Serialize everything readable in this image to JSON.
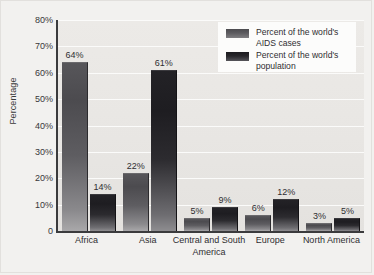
{
  "chart_data": {
    "type": "bar",
    "title": "",
    "subtitle": "",
    "xlabel": "",
    "ylabel": "Percentage",
    "categories": [
      "Africa",
      "Asia",
      "Central and South America",
      "Europe",
      "North America"
    ],
    "series": [
      {
        "name": "Percent of the world's AIDS cases",
        "values": [
          64,
          22,
          5,
          6,
          3
        ],
        "value_labels": [
          "64%",
          "22%",
          "5%",
          "6%",
          "3%"
        ],
        "color": "#4c4b4f"
      },
      {
        "name": "Percent of the world's population",
        "values": [
          14,
          61,
          9,
          12,
          5
        ],
        "value_labels": [
          "14%",
          "61%",
          "9%",
          "12%",
          "5%"
        ],
        "color": "#1c1b1f"
      }
    ],
    "ylim": [
      0,
      80
    ],
    "yticks": [
      0,
      10,
      20,
      30,
      40,
      50,
      60,
      70,
      80
    ],
    "ytick_labels": [
      "0",
      "10%",
      "20%",
      "30%",
      "40%",
      "50%",
      "60%",
      "70%",
      "80%"
    ],
    "grid": true,
    "grid_axis": "y",
    "legend_position": "top-right",
    "plot_background": "#e9e7e4",
    "figure_background": "#f2f1ef",
    "axis_color": "#3b3b3d",
    "gridline_color": "#fbfbfa"
  },
  "legend": {
    "entries": [
      {
        "label": "Percent of the world's\nAIDS cases"
      },
      {
        "label": "Percent of the world's\npopulation"
      }
    ]
  }
}
